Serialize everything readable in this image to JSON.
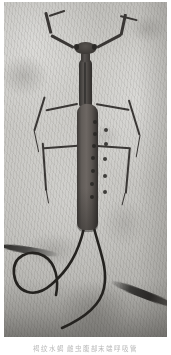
{
  "figure": {
    "kind": "photograph",
    "caption": "褐纹水蝎 雌虫腹部末端呼吸管",
    "palette": {
      "page_background": "#ffffff",
      "stone_light": "#cccbc7",
      "stone_mid": "#c2c1bd",
      "stone_dark": "#a9a8a4",
      "crack_dark": "#211f1e",
      "insect_body": "#5d5956",
      "insect_dark": "#2e2c2a",
      "caption_text": "#b9b9b9"
    },
    "plate": {
      "left": 4,
      "top": 2,
      "width": 163,
      "height": 335
    }
  },
  "insect": {
    "head_label": "head",
    "eye_left_label": "left compound eye",
    "eye_right_label": "right compound eye",
    "neck_label": "neck",
    "prothorax_label": "elongate prothorax",
    "abdomen_label": "abdomen",
    "tail_label": "caudal respiratory siphon",
    "raptorial_forelegs": [
      {
        "name": "left-foreleg",
        "segments": [
          {
            "x": 70,
            "y": 44,
            "len": 26,
            "w": 3.2,
            "rot": -152
          },
          {
            "x": 47,
            "y": 30,
            "len": 22,
            "w": 3.0,
            "rot": -104
          },
          {
            "x": 45,
            "y": 13,
            "len": 17,
            "w": 2.4,
            "rot": -18
          }
        ]
      },
      {
        "name": "right-foreleg",
        "segments": [
          {
            "x": 93,
            "y": 44,
            "len": 27,
            "w": 3.2,
            "rot": -28
          },
          {
            "x": 117,
            "y": 32,
            "len": 22,
            "w": 3.0,
            "rot": -78
          },
          {
            "x": 116,
            "y": 13,
            "len": 18,
            "w": 2.4,
            "rot": 14
          }
        ]
      }
    ],
    "walking_legs": [
      {
        "name": "left-middle-leg",
        "segments": [
          {
            "x": 74,
            "y": 101,
            "len": 33,
            "w": 1.7,
            "rot": 168
          },
          {
            "x": 41,
            "y": 94,
            "len": 36,
            "w": 1.5,
            "rot": 107
          },
          {
            "x": 30,
            "y": 128,
            "len": 22,
            "w": 1.3,
            "rot": 78
          }
        ]
      },
      {
        "name": "right-middle-leg",
        "segments": [
          {
            "x": 92,
            "y": 101,
            "len": 34,
            "w": 1.7,
            "rot": 10
          },
          {
            "x": 125,
            "y": 97,
            "len": 37,
            "w": 1.5,
            "rot": 73
          },
          {
            "x": 136,
            "y": 132,
            "len": 23,
            "w": 1.3,
            "rot": 100
          }
        ]
      },
      {
        "name": "left-hind-leg",
        "segments": [
          {
            "x": 75,
            "y": 143,
            "len": 36,
            "w": 1.7,
            "rot": 176
          },
          {
            "x": 39,
            "y": 140,
            "len": 48,
            "w": 1.5,
            "rot": 86
          },
          {
            "x": 42,
            "y": 187,
            "len": 14,
            "w": 1.3,
            "rot": 80
          }
        ]
      },
      {
        "name": "right-hind-leg",
        "segments": [
          {
            "x": 92,
            "y": 143,
            "len": 35,
            "w": 1.7,
            "rot": 4
          },
          {
            "x": 126,
            "y": 146,
            "len": 45,
            "w": 1.5,
            "rot": 95
          },
          {
            "x": 121,
            "y": 190,
            "len": 13,
            "w": 1.3,
            "rot": 104
          }
        ]
      }
    ],
    "segment_spots": [
      {
        "x": 89,
        "y": 118
      },
      {
        "x": 89,
        "y": 130
      },
      {
        "x": 88,
        "y": 142
      },
      {
        "x": 87,
        "y": 154
      },
      {
        "x": 87,
        "y": 167
      },
      {
        "x": 86,
        "y": 180
      },
      {
        "x": 86,
        "y": 193
      },
      {
        "x": 100,
        "y": 126
      },
      {
        "x": 100,
        "y": 140
      },
      {
        "x": 99,
        "y": 155
      },
      {
        "x": 99,
        "y": 172
      },
      {
        "x": 99,
        "y": 188
      }
    ],
    "tail_paths": [
      "M 80 226 C 74 252, 64 268, 48 282 C 30 298, 12 290, 10 272 C 8 254, 26 246, 40 254 C 52 261, 55 278, 52 293",
      "M 90 226 C 96 250, 104 266, 100 286 C 96 306, 76 318, 58 326"
    ]
  }
}
